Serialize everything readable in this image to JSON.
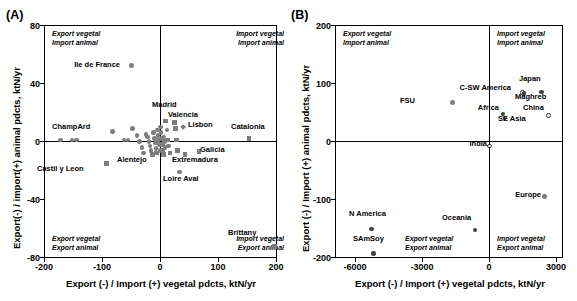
{
  "figure": {
    "panels": [
      {
        "letter": "(A)",
        "xlabel": "Export (-) / Import (+) vegetal pdcts, ktN/yr",
        "ylabel": "Export(-) / import(+) animal pdcts, ktN/yr",
        "xticks": [
          "-200",
          "-100",
          "0",
          "100",
          "200"
        ],
        "yticks": [
          "80",
          "40",
          "0",
          "-40",
          "-80"
        ],
        "quadrants": {
          "top_left_1": "Export vegetal",
          "top_left_2": "Import animal",
          "top_right_1": "Import vegetal",
          "top_right_2": "Import animal",
          "bottom_left_1": "Export vegetal",
          "bottom_left_2": "Export animal",
          "bottom_right_1": "Import vegetal",
          "bottom_right_2": "Export animal"
        },
        "labels": [
          "Ile de France",
          "ChampArd",
          "Castil y Leon",
          "Alentejo",
          "Madrid",
          "Valencia",
          "Lisbon",
          "Catalonia",
          "Galicia",
          "Extremadura",
          "Loire Aval",
          "Brittany"
        ]
      },
      {
        "letter": "(B)",
        "xlabel": "Export (-) / Import (+) vegetal pdcts, ktN/yr",
        "ylabel": "Export (-) / Import (+) animal pdcts, ktN/yr",
        "xticks": [
          "-6000",
          "-3000",
          "0",
          "3000"
        ],
        "yticks": [
          "200",
          "100",
          "0",
          "-100",
          "-200"
        ],
        "quadrants": {
          "top_left_1": "Export vegetal",
          "top_left_2": "Import animal",
          "top_right_1": "Import vegetal",
          "top_right_2": "Import animal",
          "bottom_left_1": "Export vegetal",
          "bottom_left_2": "Export animal",
          "bottom_right_1": "Import vegetal",
          "bottom_right_2": "Export animal"
        },
        "labels": [
          "FSU",
          "C-SW America",
          "Japan",
          "Maghreb",
          "Africa",
          "SE Asia",
          "China",
          "India",
          "Europe",
          "N America",
          "SAmSoy",
          "Oceania"
        ]
      }
    ]
  },
  "chart_data": [
    {
      "type": "scatter",
      "panel": "(A)",
      "title": "",
      "xlabel": "Export (-) / Import (+) vegetal pdcts, ktN/yr",
      "ylabel": "Export(-) / import(+) animal pdcts, ktN/yr",
      "xlim": [
        -200,
        200
      ],
      "ylim": [
        -80,
        80
      ],
      "xticks": [
        -200,
        -100,
        0,
        100,
        200
      ],
      "yticks": [
        -80,
        -40,
        0,
        40,
        80
      ],
      "grid": false,
      "legend": "none",
      "annotations": [
        "Export vegetal / Import animal (top-left)",
        "Import vegetal / Import animal (top-right)",
        "Export vegetal / Export animal (bottom-left)",
        "Import vegetal / Export animal (bottom-right)"
      ],
      "points": [
        {
          "label": "Ile de France",
          "x": -50,
          "y": 52,
          "marker": "circle",
          "fill": "gray"
        },
        {
          "label": "ChampArd",
          "x": -172,
          "y": 1,
          "marker": "circle",
          "fill": "gray"
        },
        {
          "label": "",
          "x": -152,
          "y": 1,
          "marker": "circle",
          "fill": "gray"
        },
        {
          "label": "",
          "x": -144,
          "y": 1,
          "marker": "circle",
          "fill": "gray"
        },
        {
          "label": "Castil y Leon",
          "x": -93,
          "y": -15,
          "marker": "square",
          "fill": "gray"
        },
        {
          "label": "",
          "x": -82,
          "y": 7,
          "marker": "circle",
          "fill": "gray"
        },
        {
          "label": "",
          "x": -63,
          "y": 1,
          "marker": "circle",
          "fill": "gray"
        },
        {
          "label": "",
          "x": -56,
          "y": 1,
          "marker": "circle",
          "fill": "gray"
        },
        {
          "label": "",
          "x": -48,
          "y": 9,
          "marker": "circle",
          "fill": "gray"
        },
        {
          "label": "",
          "x": -40,
          "y": 4,
          "marker": "circle",
          "fill": "gray"
        },
        {
          "label": "",
          "x": -36,
          "y": 0,
          "marker": "circle",
          "fill": "gray"
        },
        {
          "label": "",
          "x": -32,
          "y": -4,
          "marker": "circle",
          "fill": "gray"
        },
        {
          "label": "",
          "x": -29,
          "y": -8,
          "marker": "circle",
          "fill": "gray"
        },
        {
          "label": "",
          "x": -25,
          "y": 5,
          "marker": "circle",
          "fill": "gray"
        },
        {
          "label": "",
          "x": -22,
          "y": 3,
          "marker": "circle",
          "fill": "gray"
        },
        {
          "label": "",
          "x": -20,
          "y": 0,
          "marker": "circle",
          "fill": "gray"
        },
        {
          "label": "",
          "x": -18,
          "y": -3,
          "marker": "circle",
          "fill": "gray"
        },
        {
          "label": "",
          "x": -16,
          "y": -6,
          "marker": "circle",
          "fill": "gray"
        },
        {
          "label": "",
          "x": -14,
          "y": -9,
          "marker": "square",
          "fill": "gray"
        },
        {
          "label": "",
          "x": -12,
          "y": 6,
          "marker": "circle",
          "fill": "gray"
        },
        {
          "label": "",
          "x": -10,
          "y": 2,
          "marker": "circle",
          "fill": "gray"
        },
        {
          "label": "",
          "x": -9,
          "y": -1,
          "marker": "circle",
          "fill": "gray"
        },
        {
          "label": "",
          "x": -8,
          "y": -5,
          "marker": "circle",
          "fill": "gray"
        },
        {
          "label": "Alentejo",
          "x": -7,
          "y": -8,
          "marker": "square",
          "fill": "gray"
        },
        {
          "label": "",
          "x": -5,
          "y": 8,
          "marker": "circle",
          "fill": "gray"
        },
        {
          "label": "",
          "x": -4,
          "y": 4,
          "marker": "circle",
          "fill": "gray"
        },
        {
          "label": "",
          "x": -3,
          "y": 1,
          "marker": "circle",
          "fill": "gray"
        },
        {
          "label": "",
          "x": -2,
          "y": -2,
          "marker": "circle",
          "fill": "gray"
        },
        {
          "label": "",
          "x": -1,
          "y": -6,
          "marker": "circle",
          "fill": "gray"
        },
        {
          "label": "",
          "x": 0,
          "y": 10,
          "marker": "circle",
          "fill": "gray"
        },
        {
          "label": "",
          "x": 1,
          "y": 6,
          "marker": "circle",
          "fill": "gray"
        },
        {
          "label": "",
          "x": 2,
          "y": 2,
          "marker": "circle",
          "fill": "gray"
        },
        {
          "label": "",
          "x": 3,
          "y": -2,
          "marker": "circle",
          "fill": "gray"
        },
        {
          "label": "",
          "x": 4,
          "y": -6,
          "marker": "square",
          "fill": "gray"
        },
        {
          "label": "",
          "x": 5,
          "y": -9,
          "marker": "square",
          "fill": "gray"
        },
        {
          "label": "",
          "x": 6,
          "y": 3,
          "marker": "circle",
          "fill": "gray"
        },
        {
          "label": "",
          "x": 7,
          "y": 0,
          "marker": "circle",
          "fill": "gray"
        },
        {
          "label": "",
          "x": 8,
          "y": -4,
          "marker": "circle",
          "fill": "gray"
        },
        {
          "label": "Madrid",
          "x": 9,
          "y": 14,
          "marker": "square",
          "fill": "gray"
        },
        {
          "label": "",
          "x": 11,
          "y": 8,
          "marker": "circle",
          "fill": "gray"
        },
        {
          "label": "",
          "x": 12,
          "y": 1,
          "marker": "square",
          "fill": "gray"
        },
        {
          "label": "",
          "x": 14,
          "y": -3,
          "marker": "circle",
          "fill": "gray"
        },
        {
          "label": "",
          "x": 16,
          "y": -8,
          "marker": "square",
          "fill": "gray"
        },
        {
          "label": "Valencia",
          "x": 24,
          "y": 13,
          "marker": "square",
          "fill": "gray"
        },
        {
          "label": "",
          "x": 26,
          "y": 9,
          "marker": "square",
          "fill": "gray"
        },
        {
          "label": "",
          "x": 27,
          "y": 1,
          "marker": "square",
          "fill": "gray"
        },
        {
          "label": "",
          "x": 29,
          "y": -6,
          "marker": "square",
          "fill": "gray"
        },
        {
          "label": "Lisbon",
          "x": 38,
          "y": 10,
          "marker": "diamond",
          "fill": "gray"
        },
        {
          "label": "Loire Aval",
          "x": 33,
          "y": -21,
          "marker": "circle",
          "fill": "gray"
        },
        {
          "label": "Extremadura",
          "x": 42,
          "y": -9,
          "marker": "square",
          "fill": "gray"
        },
        {
          "label": "Galicia",
          "x": 66,
          "y": -7,
          "marker": "square",
          "fill": "gray"
        },
        {
          "label": "Catalonia",
          "x": 152,
          "y": 2,
          "marker": "square",
          "fill": "gray"
        },
        {
          "label": "Brittany",
          "x": 196,
          "y": -72,
          "marker": "square",
          "fill": "gray"
        }
      ]
    },
    {
      "type": "scatter",
      "panel": "(B)",
      "title": "",
      "xlabel": "Export (-) / Import (+) vegetal pdcts, ktN/yr",
      "ylabel": "Export (-) / Import (+) animal pdcts, ktN/yr",
      "xlim": [
        -6900,
        3300
      ],
      "ylim": [
        -200,
        200
      ],
      "xticks": [
        -6000,
        -3000,
        0,
        3000
      ],
      "yticks": [
        -200,
        -100,
        0,
        100,
        200
      ],
      "grid": false,
      "legend": "none",
      "annotations": [
        "Export vegetal / Import animal (top-left)",
        "Import vegetal / Import animal (top-right)",
        "Export vegetal / Export animal (bottom-left)",
        "Import vegetal / Export animal (bottom-right)"
      ],
      "points": [
        {
          "label": "FSU",
          "x": -1650,
          "y": 67,
          "marker": "circle",
          "fill": "gray"
        },
        {
          "label": "C-SW America",
          "x": 1500,
          "y": 84,
          "marker": "circle",
          "fill": "open"
        },
        {
          "label": "Japan",
          "x": 2330,
          "y": 85,
          "marker": "circle",
          "fill": "dark"
        },
        {
          "label": "Maghreb",
          "x": 1560,
          "y": 82,
          "marker": "circle",
          "fill": "dark"
        },
        {
          "label": "Africa",
          "x": 620,
          "y": 47,
          "marker": "circle",
          "fill": "dark"
        },
        {
          "label": "SE Asia",
          "x": 700,
          "y": 40,
          "marker": "circle",
          "fill": "open"
        },
        {
          "label": "China",
          "x": 2660,
          "y": 45,
          "marker": "circle",
          "fill": "open"
        },
        {
          "label": "India",
          "x": 10,
          "y": -8,
          "marker": "circle",
          "fill": "open"
        },
        {
          "label": "Europe",
          "x": 2480,
          "y": -94,
          "marker": "circle",
          "fill": "gray"
        },
        {
          "label": "N America",
          "x": -5270,
          "y": -150,
          "marker": "circle",
          "fill": "dark"
        },
        {
          "label": "SAmSoy",
          "x": -5180,
          "y": -192,
          "marker": "circle",
          "fill": "dark"
        },
        {
          "label": "Oceania",
          "x": -640,
          "y": -152,
          "marker": "circle",
          "fill": "dark"
        }
      ]
    }
  ],
  "colors": {
    "marker_gray": "#7d7d7d",
    "marker_dark": "#404040",
    "axis": "#000000",
    "background": "#ffffff"
  }
}
